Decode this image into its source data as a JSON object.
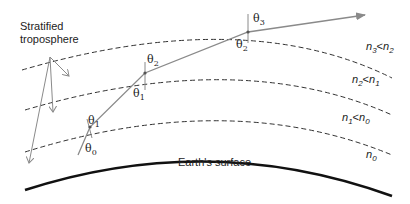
{
  "title_label": "Stratified troposphere",
  "title_lines": [
    "Stratified",
    "troposphere"
  ],
  "surface_label": "Earth's surface",
  "layers": [
    {
      "id": "layer0",
      "label_main": "n",
      "label_sub": "0",
      "full": "n0"
    },
    {
      "id": "layer1",
      "label_main": "n",
      "label_sub": "1",
      "rel": "<",
      "cmp_main": "n",
      "cmp_sub": "0",
      "full": "n1<n0"
    },
    {
      "id": "layer2",
      "label_main": "n",
      "label_sub": "2",
      "rel": "<",
      "cmp_main": "n",
      "cmp_sub": "1",
      "full": "n2<n1"
    },
    {
      "id": "layer3",
      "label_main": "n",
      "label_sub": "3",
      "rel": "<",
      "cmp_main": "n",
      "cmp_sub": "2",
      "full": "n3<n2"
    }
  ],
  "angles": [
    {
      "symbol": "θ",
      "sub": "0"
    },
    {
      "symbol": "θ",
      "sub": "1"
    },
    {
      "symbol": "θ",
      "sub": "1"
    },
    {
      "symbol": "θ",
      "sub": "2"
    },
    {
      "symbol": "θ",
      "sub": "2"
    },
    {
      "symbol": "θ",
      "sub": "3"
    }
  ],
  "colors": {
    "ray": "#8a8a8a",
    "surface": "#111111",
    "dashed": "#333333",
    "text": "#222222"
  }
}
